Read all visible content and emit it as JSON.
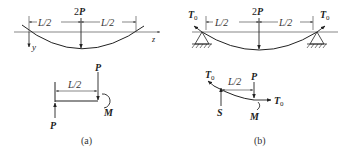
{
  "figure_a": {
    "caption": "(a)",
    "top": {
      "load_label": "2",
      "load_symbol": "P",
      "left_dim": "L/2",
      "right_dim": "L/2",
      "x_axis_label": "z",
      "y_axis_label": "y"
    },
    "free_body": {
      "dim": "L/2",
      "top_force_label": "P",
      "bottom_force_label": "P",
      "moment_label": "M"
    }
  },
  "figure_b": {
    "caption": "(b)",
    "top": {
      "load_label": "2",
      "load_symbol": "P",
      "left_dim": "L/2",
      "right_dim": "L/2",
      "left_tension_label": "T",
      "left_tension_sub": "0",
      "right_tension_label": "T",
      "right_tension_sub": "0"
    },
    "free_body": {
      "dim": "L/2",
      "force_label": "P",
      "shear_label": "S",
      "moment_label": "M",
      "left_tension_label": "T",
      "left_tension_sub": "0",
      "right_tension_label": "T",
      "right_tension_sub": "0"
    }
  }
}
